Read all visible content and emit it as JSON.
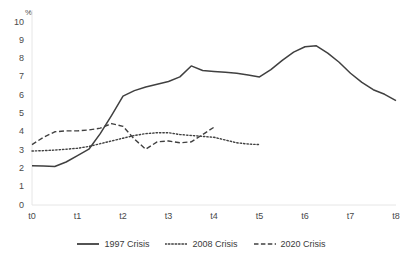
{
  "chart_data": {
    "type": "line",
    "title": "",
    "xlabel": "",
    "ylabel": "%",
    "y_unit_label": "%",
    "ylim": [
      0,
      10
    ],
    "xlim": [
      0,
      8
    ],
    "grid": false,
    "legend_position": "bottom-center",
    "ytick_labels": [
      "10",
      "9",
      "8",
      "7",
      "6",
      "5",
      "4",
      "3",
      "2",
      "1",
      "0"
    ],
    "ytick_values": [
      10,
      9,
      8,
      7,
      6,
      5,
      4,
      3,
      2,
      1,
      0
    ],
    "xtick_labels": [
      "t0",
      "t1",
      "t2",
      "t3",
      "t4",
      "t5",
      "t6",
      "t7",
      "t8"
    ],
    "xtick_values": [
      0,
      1,
      2,
      3,
      4,
      5,
      6,
      7,
      8
    ],
    "series": [
      {
        "name": "1997 Crisis",
        "style": "solid",
        "color": "#404040",
        "x": [
          0,
          0.25,
          0.5,
          0.75,
          1.0,
          1.25,
          1.5,
          1.75,
          2.0,
          2.25,
          2.5,
          2.75,
          3.0,
          3.25,
          3.5,
          3.75,
          4.0,
          4.25,
          4.5,
          4.75,
          5.0,
          5.25,
          5.5,
          5.75,
          6.0,
          6.25,
          6.5,
          6.75,
          7.0,
          7.25,
          7.5,
          7.75,
          8.0
        ],
        "values": [
          2.15,
          2.13,
          2.1,
          2.35,
          2.7,
          3.05,
          3.9,
          4.9,
          5.95,
          6.25,
          6.45,
          6.6,
          6.75,
          7.0,
          7.6,
          7.35,
          7.3,
          7.25,
          7.2,
          7.1,
          7.0,
          7.4,
          7.9,
          8.35,
          8.65,
          8.7,
          8.3,
          7.8,
          7.2,
          6.7,
          6.3,
          6.05,
          5.7
        ]
      },
      {
        "name": "2008 Crisis",
        "style": "dotted",
        "color": "#404040",
        "x": [
          0,
          0.25,
          0.5,
          0.75,
          1.0,
          1.25,
          1.5,
          1.75,
          2.0,
          2.25,
          2.5,
          2.75,
          3.0,
          3.25,
          3.5,
          3.75,
          4.0,
          4.25,
          4.5,
          4.75,
          5.0
        ],
        "values": [
          2.95,
          2.97,
          3.0,
          3.05,
          3.1,
          3.2,
          3.35,
          3.5,
          3.65,
          3.8,
          3.9,
          3.95,
          3.95,
          3.85,
          3.8,
          3.75,
          3.7,
          3.55,
          3.4,
          3.33,
          3.3
        ]
      },
      {
        "name": "2020 Crisis",
        "style": "dashed",
        "color": "#404040",
        "x": [
          0,
          0.25,
          0.5,
          0.75,
          1.0,
          1.25,
          1.5,
          1.75,
          2.0,
          2.25,
          2.5,
          2.75,
          3.0,
          3.25,
          3.5,
          3.75,
          4.0
        ],
        "values": [
          3.3,
          3.7,
          4.0,
          4.05,
          4.05,
          4.1,
          4.2,
          4.45,
          4.3,
          3.6,
          3.05,
          3.45,
          3.5,
          3.4,
          3.45,
          3.85,
          4.25
        ]
      }
    ]
  },
  "legend": {
    "items": [
      {
        "label": "1997 Crisis",
        "style": "solid"
      },
      {
        "label": "2008 Crisis",
        "style": "dotted"
      },
      {
        "label": "2020 Crisis",
        "style": "dashed"
      }
    ]
  },
  "axes": {
    "unit_label": "%",
    "axis_color": "#e6e6e6"
  }
}
